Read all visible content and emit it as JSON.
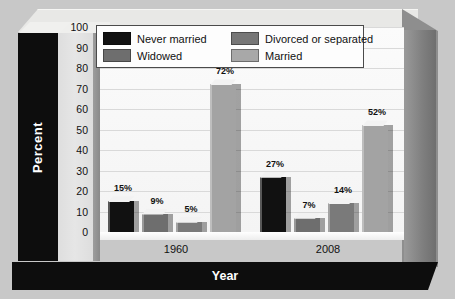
{
  "chart_data": {
    "type": "bar",
    "title": "",
    "xlabel": "Year",
    "ylabel": "Percent",
    "categories": [
      "1960",
      "2008"
    ],
    "ylim": [
      0,
      100
    ],
    "yticks": [
      100,
      90,
      80,
      70,
      60,
      50,
      40,
      30,
      20,
      10,
      0
    ],
    "grid": true,
    "legend_position": "top",
    "series": [
      {
        "name": "Never married",
        "color": "#111111",
        "values": [
          15,
          27
        ],
        "labels": [
          "15%",
          "27%"
        ]
      },
      {
        "name": "Widowed",
        "color": "#6e6e6e",
        "values": [
          9,
          7
        ],
        "labels": [
          "9%",
          "7%"
        ]
      },
      {
        "name": "Divorced or separated",
        "color": "#7a7a7a",
        "values": [
          5,
          14
        ],
        "labels": [
          "5%",
          "14%"
        ]
      },
      {
        "name": "Married",
        "color": "#a3a3a3",
        "values": [
          72,
          52
        ],
        "labels": [
          "72%",
          "52%"
        ]
      }
    ]
  },
  "legend": {
    "items": [
      {
        "label": "Never married",
        "color": "#111111"
      },
      {
        "label": "Divorced or separated",
        "color": "#767676"
      },
      {
        "label": "Widowed",
        "color": "#6e6e6e"
      },
      {
        "label": "Married",
        "color": "#a8a8a8"
      }
    ]
  },
  "axes": {
    "y_title": "Percent",
    "x_title": "Year",
    "y_ticks": [
      "100",
      "90",
      "80",
      "70",
      "60",
      "50",
      "40",
      "30",
      "20",
      "10",
      "0"
    ],
    "x_categories": [
      "1960",
      "2008"
    ]
  }
}
